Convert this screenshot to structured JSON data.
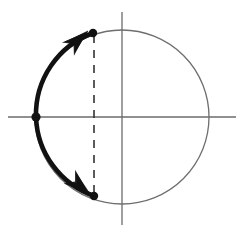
{
  "figure": {
    "background_color": "#ffffff",
    "width": 244,
    "height": 238
  },
  "chart_data": {
    "type": "scatter",
    "title": "",
    "xlabel": "",
    "ylabel": "",
    "grid": false,
    "legend": null,
    "axes": {
      "origin": {
        "x": 122,
        "y": 117
      },
      "horizontal": {
        "x1": 8,
        "y1": 117,
        "x2": 236,
        "y2": 117,
        "color": "#6b6b6b",
        "width": 1.3
      },
      "vertical": {
        "x1": 122,
        "y1": 12,
        "x2": 122,
        "y2": 225,
        "color": "#6b6b6b",
        "width": 1.3
      }
    },
    "circle": {
      "cx": 122,
      "cy": 117,
      "r": 87,
      "stroke": "#6e6e6e",
      "stroke_width": 1.3,
      "fill": "none"
    },
    "thick_arc": {
      "description": "Bold left arc of the circle running from the upper point, through the leftmost point, down to the lower point",
      "stroke": "#111111",
      "stroke_width": 4.6,
      "start": {
        "x": 93,
        "y": 33
      },
      "via": {
        "x": 36,
        "y": 117
      },
      "end": {
        "x": 94,
        "y": 196
      },
      "direction": "outward from leftmost point toward both endpoints"
    },
    "dashed_chord": {
      "x": 94,
      "y1": 33,
      "y2": 196,
      "stroke": "#333333",
      "stroke_width": 1.6,
      "dash_pattern": "8 7"
    },
    "points": [
      {
        "name": "left-point",
        "x": 36,
        "y": 117,
        "r": 4.6,
        "color": "#111111"
      },
      {
        "name": "upper-point",
        "x": 93,
        "y": 33,
        "r": 4.2,
        "color": "#111111"
      },
      {
        "name": "lower-point",
        "x": 94,
        "y": 196,
        "r": 4.2,
        "color": "#111111"
      }
    ],
    "arrowheads": [
      {
        "name": "upper-arrowhead",
        "tip_x": 88,
        "tip_y": 31,
        "angle_deg": -42,
        "color": "#111111"
      },
      {
        "name": "lower-arrowhead",
        "tip_x": 90,
        "tip_y": 194,
        "angle_deg": 40,
        "color": "#111111"
      }
    ]
  }
}
